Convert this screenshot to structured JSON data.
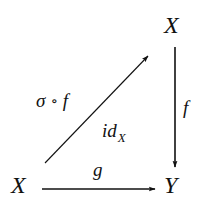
{
  "diagram": {
    "type": "commutative-diagram",
    "nodes": {
      "top_right": {
        "label": "X"
      },
      "bottom_left": {
        "label": "X"
      },
      "bottom_right": {
        "label": "Y"
      }
    },
    "arrows": {
      "vertical": {
        "from": "top_right",
        "to": "bottom_right",
        "label": "f"
      },
      "horizontal": {
        "from": "bottom_left",
        "to": "bottom_right",
        "label": "g"
      },
      "diagonal": {
        "from": "bottom_left",
        "to": "top_right",
        "label_left": {
          "sigma": "σ",
          "compose": "∘",
          "f": "f"
        },
        "label_right": {
          "base": "id",
          "subscript": "X"
        }
      }
    },
    "colors": {
      "ink": "#111111",
      "background": "#ffffff"
    }
  }
}
